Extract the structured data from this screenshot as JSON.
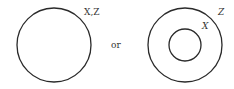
{
  "diagram": {
    "left": {
      "label": "X,Z"
    },
    "connector": "or",
    "right": {
      "outer_label": "Z",
      "inner_label": "X"
    },
    "stroke_color": "#2a2a2a"
  }
}
